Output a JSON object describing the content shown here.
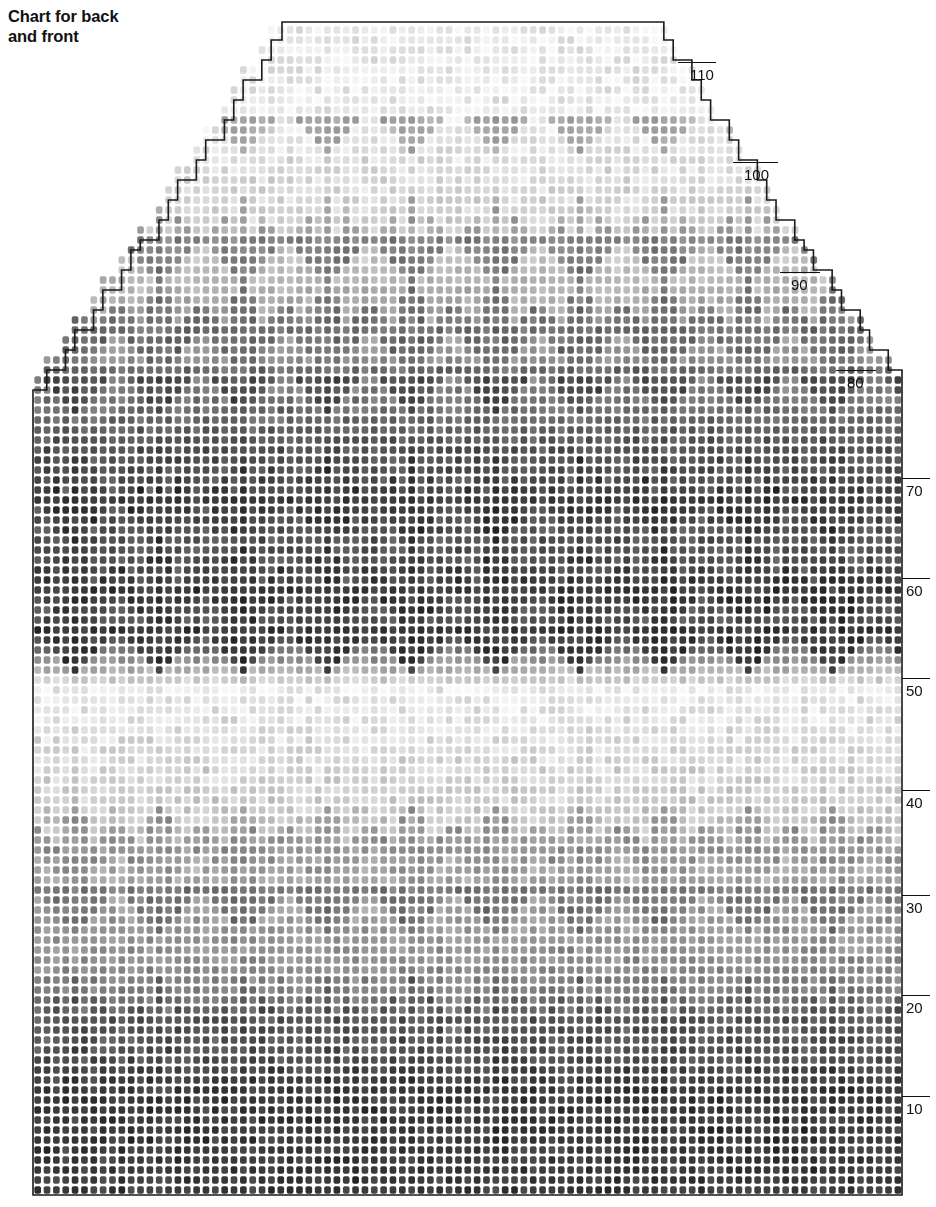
{
  "title": {
    "line1": "Chart for back",
    "line2": "and front",
    "text": "Chart for back\nand front"
  },
  "colors": {
    "ink": "#111111",
    "paper": "#ffffff",
    "stitch_dark": "#3a3a3a",
    "stitch_mid": "#8d8d8d",
    "stitch_light": "#d8d8d8",
    "stitch_pale": "#efefef",
    "outline": "#1a1a1a"
  },
  "chart_data": {
    "type": "heatmap",
    "title": "Chart for back and front",
    "xlabel": "",
    "ylabel": "Row number",
    "grid": true,
    "legend_position": "none",
    "stitch_columns": 93,
    "stitch_rows": 120,
    "cell_width_px": 9.35,
    "cell_height_px": 10.0,
    "row_numbering": {
      "direction": "bottom-to-top",
      "side": "right",
      "interval": 10,
      "tick_labels": [
        "10",
        "20",
        "30",
        "40",
        "50",
        "60",
        "70",
        "80",
        "90",
        "100",
        "110"
      ],
      "tick_values": [
        10,
        20,
        30,
        40,
        50,
        60,
        70,
        80,
        90,
        100,
        110
      ]
    },
    "ticks": [
      {
        "label": "110",
        "row": 110,
        "y": 62,
        "x1": 678,
        "x2": 716,
        "text_x": 690,
        "text_y": 63
      },
      {
        "label": "100",
        "row": 100,
        "y": 162,
        "x1": 733,
        "x2": 778,
        "text_x": 744,
        "text_y": 163
      },
      {
        "label": "90",
        "row": 90,
        "y": 272,
        "x1": 780,
        "x2": 820,
        "text_x": 791,
        "text_y": 273
      },
      {
        "label": "80",
        "row": 80,
        "y": 370,
        "x1": 836,
        "x2": 876,
        "text_x": 847,
        "text_y": 371
      },
      {
        "label": "70",
        "row": 70,
        "y": 478,
        "x1": 902,
        "x2": 930,
        "text_x": 906,
        "text_y": 479
      },
      {
        "label": "60",
        "row": 60,
        "y": 578,
        "x1": 902,
        "x2": 930,
        "text_x": 906,
        "text_y": 579
      },
      {
        "label": "50",
        "row": 50,
        "y": 678,
        "x1": 902,
        "x2": 930,
        "text_x": 906,
        "text_y": 679
      },
      {
        "label": "40",
        "row": 40,
        "y": 790,
        "x1": 902,
        "x2": 930,
        "text_x": 906,
        "text_y": 791
      },
      {
        "label": "30",
        "row": 30,
        "y": 895,
        "x1": 902,
        "x2": 930,
        "text_x": 906,
        "text_y": 896
      },
      {
        "label": "20",
        "row": 20,
        "y": 995,
        "x1": 902,
        "x2": 930,
        "text_x": 906,
        "text_y": 996
      },
      {
        "label": "10",
        "row": 10,
        "y": 1096,
        "x1": 902,
        "x2": 930,
        "text_x": 906,
        "text_y": 1097
      }
    ],
    "silhouette": {
      "body_left_px": 33,
      "body_right_px": 902,
      "body_bottom_px": 1195,
      "armhole_top_px": 390,
      "shoulder_top_px": 22,
      "neck_top_left_px": 283,
      "neck_top_right_px": 653,
      "description": "Sweater back/front: straight body to armhole at row ~80, then stepped raglan shaping to shoulders."
    },
    "motif": {
      "name": "tree-chevron",
      "horizontal_repeat_stitches": 9,
      "vertical_repeat_rows": 26
    },
    "bands": [
      {
        "name": "ribbed-dark-hem",
        "rows": [
          1,
          11
        ],
        "tone": "dark"
      },
      {
        "name": "dark-to-mid-fade",
        "rows": [
          11,
          22
        ],
        "tone": "dark-mid"
      },
      {
        "name": "mid-grey",
        "rows": [
          22,
          32
        ],
        "tone": "mid"
      },
      {
        "name": "light-trees",
        "rows": [
          32,
          38
        ],
        "tone": "light"
      },
      {
        "name": "palest-band",
        "rows": [
          38,
          50
        ],
        "tone": "pale"
      },
      {
        "name": "dark-tree-band",
        "rows": [
          50,
          73
        ],
        "tone": "dark"
      },
      {
        "name": "mid-grey-yoke",
        "rows": [
          73,
          95
        ],
        "tone": "mid"
      },
      {
        "name": "light-yoke-trees",
        "rows": [
          95,
          108
        ],
        "tone": "light"
      },
      {
        "name": "palest-shoulder",
        "rows": [
          108,
          120
        ],
        "tone": "pale"
      }
    ]
  }
}
